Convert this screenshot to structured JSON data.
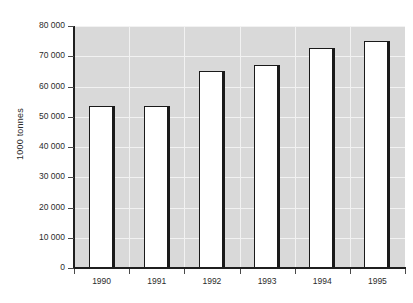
{
  "chart_data": {
    "type": "bar",
    "title": "",
    "subtitle": "",
    "xlabel": "",
    "ylabel": "1000 tonnes",
    "categories": [
      "1990",
      "1991",
      "1992",
      "1993",
      "1994",
      "1995"
    ],
    "values": [
      53600,
      53600,
      65000,
      67000,
      72800,
      75200
    ],
    "series": [
      {
        "name": "1000 tonnes",
        "values": [
          53600,
          53600,
          65000,
          67000,
          72800,
          75200
        ]
      }
    ],
    "ylim": [
      0,
      80000
    ],
    "ytick_values": [
      0,
      10000,
      20000,
      30000,
      40000,
      50000,
      60000,
      70000,
      80000
    ],
    "ytick_labels": [
      "0",
      "10 000",
      "20 000",
      "30 000",
      "40 000",
      "50 000",
      "60 000",
      "70 000",
      "80 000"
    ],
    "grid": true,
    "grid_color": "#f2f2f2",
    "legend": false,
    "legend_position": "none",
    "plot_background": "#d9d9d9",
    "figure_background": "#ffffff",
    "bar_fill": "#ffffff",
    "bar_edge": "#1a1a1a",
    "axis_color": "#1f1f1f",
    "text_color": "#2b2b2b",
    "annotations": []
  }
}
